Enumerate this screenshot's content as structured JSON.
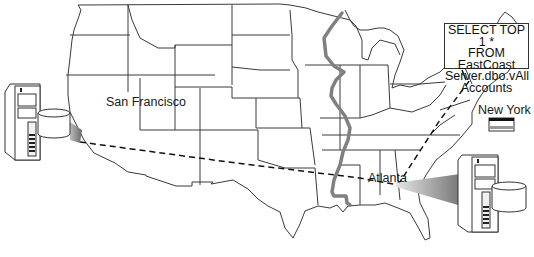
{
  "diagram": {
    "type": "distributed-query-map",
    "region": "United States",
    "locations": [
      {
        "name": "San Francisco",
        "role": "server"
      },
      {
        "name": "Atlanta",
        "role": "server"
      },
      {
        "name": "New York",
        "role": "flag"
      }
    ],
    "query": {
      "lines": [
        "SELECT TOP 1 *",
        "FROM EastCoast",
        "Server.dbo.vAll",
        "Accounts"
      ]
    },
    "features": {
      "mississippi_river": "thick gray line",
      "connection": "dashed line San Francisco → Atlanta → query box"
    },
    "colors": {
      "map_line": "#3a3a3a",
      "river": "#7a7a7a",
      "dash": "#111111"
    }
  }
}
